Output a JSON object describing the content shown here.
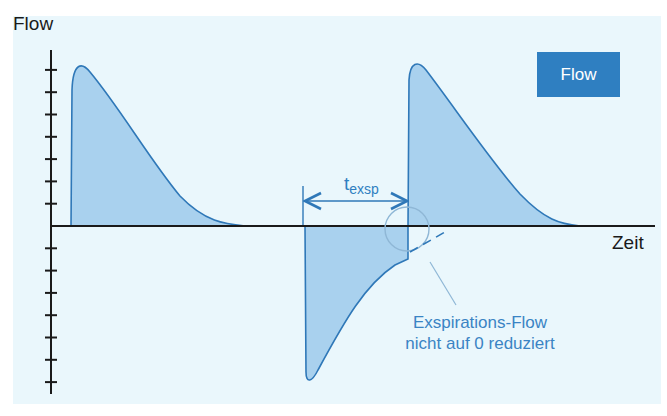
{
  "figure": {
    "y_axis_label": "Flow",
    "x_axis_label": "Zeit",
    "badge_label": "Flow",
    "interval_label_main": "t",
    "interval_label_sub": "exsp",
    "annotation_line1": "Exspirations-Flow",
    "annotation_line2": "nicht auf 0 reduziert"
  },
  "colors": {
    "panel_background": "#eaf7fc",
    "curve_fill": "#a9d1ee",
    "curve_stroke": "#2f78b8",
    "badge_background": "#2f7fc1",
    "annotation_text": "#3a84c4",
    "axis": "#1a1a1a"
  },
  "chart_data": {
    "type": "area",
    "title": "Flow",
    "xlabel": "Zeit",
    "ylabel": "Flow",
    "y_ticks_above_zero": 7,
    "y_ticks_below_zero": 7,
    "tick_labels": [],
    "series": [
      {
        "name": "Inspiration 1",
        "shape": "rapid rise to peak, exponential decay to 0",
        "peak_flow_ticks": 6.5
      },
      {
        "name": "Exspiration",
        "shape": "sharp negative peak, gradual return toward 0, interrupted before reaching 0",
        "peak_flow_ticks": -7.0,
        "end_flow_ticks": -1.1
      },
      {
        "name": "Inspiration 2",
        "shape": "rapid rise to peak, exponential decay to 0",
        "peak_flow_ticks": 6.5
      }
    ],
    "annotations": [
      {
        "text": "t_exsp",
        "type": "interval-arrow",
        "spans": "start of exspiration to start of next inspiration"
      },
      {
        "text": "Exspirations-Flow nicht auf 0 reduziert",
        "type": "callout",
        "target": "circled end of exspiration flow"
      }
    ],
    "legend": "top-right badge"
  }
}
